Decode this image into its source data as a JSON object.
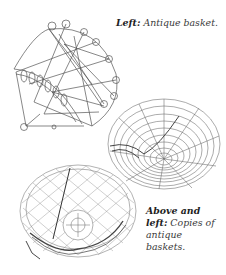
{
  "page": {
    "background": "#ffffff",
    "ink_color": "#555555"
  },
  "illustrations": [
    {
      "id": "antique-basket",
      "description": "Wire antique basket with looped rim, tilted, with scroll feet",
      "position": "top-left"
    },
    {
      "id": "copy-basket-shallow",
      "description": "Shallow round wire basket with concentric rings and radial spokes, viewed from above",
      "position": "middle-right"
    },
    {
      "id": "copy-basket-deep",
      "description": "Deep round wire basket with mesh netting and central ring at bottom",
      "position": "bottom-left"
    }
  ],
  "captions": {
    "top": {
      "label": "Left:",
      "text": "Antique basket."
    },
    "bottom": {
      "label": "Above and left:",
      "text": "Copies of antique baskets."
    }
  }
}
